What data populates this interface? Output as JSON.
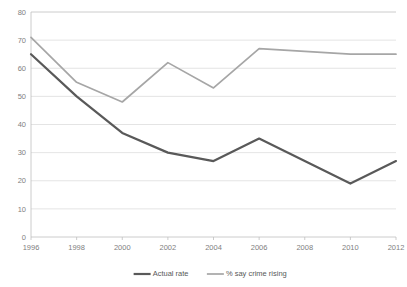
{
  "chart_data": {
    "type": "line",
    "title": "",
    "subtitle": "",
    "xlabel": "",
    "ylabel": "",
    "x": [
      1996,
      1998,
      2000,
      2002,
      2004,
      2006,
      2008,
      2010,
      2012
    ],
    "categories": [
      "1996",
      "1998",
      "2000",
      "2002",
      "2004",
      "2006",
      "2008",
      "2010",
      "2012"
    ],
    "xlim": [
      1996,
      2012
    ],
    "ylim": [
      0,
      80
    ],
    "y_ticks": [
      0,
      10,
      20,
      30,
      40,
      50,
      60,
      70,
      80
    ],
    "y_tick_labels": [
      "0",
      "10",
      "20",
      "30",
      "40",
      "50",
      "60",
      "70",
      "80"
    ],
    "x_tick_labels": [
      "1996",
      "1998",
      "2000",
      "2002",
      "2004",
      "2006",
      "2008",
      "2010",
      "2012"
    ],
    "grid": true,
    "grid_axis": "y",
    "legend_position": "bottom",
    "series": [
      {
        "name": "Actual rate",
        "color": "#595959",
        "line_width": 2.2,
        "values": [
          65,
          50,
          37,
          30,
          27,
          35,
          27,
          19,
          27
        ]
      },
      {
        "name": "% say crime rising",
        "color": "#a6a6a6",
        "line_width": 1.7,
        "values": [
          71,
          55,
          48,
          62,
          53,
          67,
          66,
          65,
          65
        ]
      }
    ]
  },
  "legend": {
    "items": [
      {
        "label": "Actual rate",
        "color": "#595959"
      },
      {
        "label": "% say crime rising",
        "color": "#a6a6a6"
      }
    ]
  },
  "axes": {
    "y_labels": [
      "80",
      "70",
      "60",
      "50",
      "40",
      "30",
      "20",
      "10",
      "0"
    ],
    "x_labels": [
      "1996",
      "1998",
      "2000",
      "2002",
      "2004",
      "2006",
      "2008",
      "2010",
      "2012"
    ]
  }
}
